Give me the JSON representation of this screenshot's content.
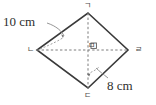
{
  "figure": {
    "type": "rhombus-geometry-diagram",
    "shape_name": "rhombus",
    "vertices": {
      "top": "ㄱ",
      "left": "ㄴ",
      "bottom": "ㄷ",
      "right": "ㄹ"
    },
    "center": "ㅁ",
    "measurements": [
      {
        "label": "10 cm",
        "value": 10,
        "unit": "cm",
        "applies_to": "side-nieun-giyeok"
      },
      {
        "label": "8 cm",
        "value": 8,
        "unit": "cm",
        "applies_to": "side-digeut-rieul"
      }
    ],
    "colors": {
      "edge": "#3a3a3a",
      "diagonal": "#8a8a8a",
      "leader": "#7a7a7a",
      "text": "#2e2e2e",
      "background": "#ffffff"
    },
    "geometry": {
      "top_point": [
        88,
        13
      ],
      "left_point": [
        37,
        50
      ],
      "bottom_point": [
        88,
        88
      ],
      "right_point": [
        128,
        50
      ]
    }
  }
}
